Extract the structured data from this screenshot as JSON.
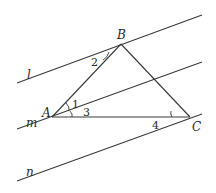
{
  "diagram": {
    "lines": {
      "l": {
        "label": "l"
      },
      "m": {
        "label": "m"
      },
      "n": {
        "label": "n"
      }
    },
    "points": {
      "A": {
        "label": "A"
      },
      "B": {
        "label": "B"
      },
      "C": {
        "label": "C"
      }
    },
    "angles": {
      "angle1": {
        "label": "1"
      },
      "angle2": {
        "label": "2"
      },
      "angle3": {
        "label": "3"
      },
      "angle4": {
        "label": "4"
      }
    },
    "colors": {
      "stroke": "#3a3a3a",
      "background": "#ffffff"
    }
  }
}
